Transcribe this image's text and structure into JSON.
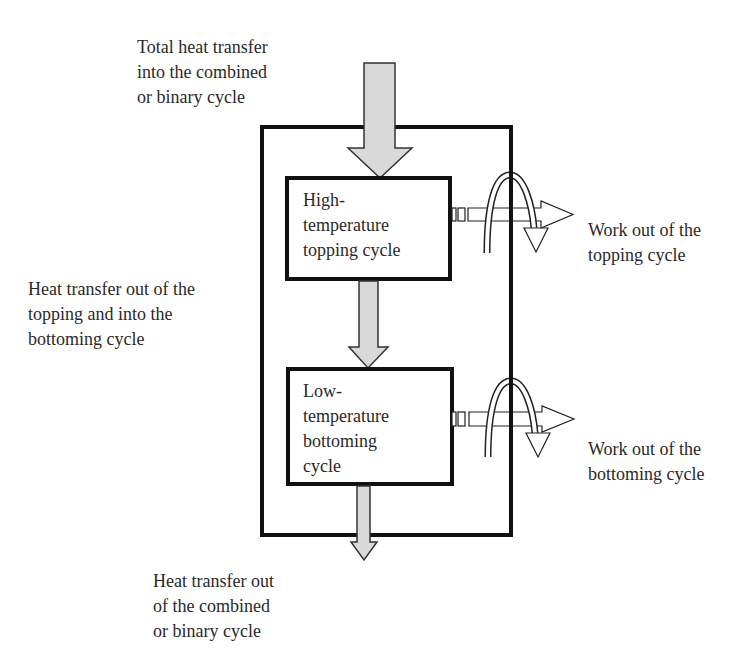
{
  "diagram": {
    "colors": {
      "line": "#111111",
      "arrow_fill": "#d9d9d9",
      "hollow_fill": "#ffffff",
      "text": "#2a2a2a",
      "background": "#ffffff"
    },
    "labels": {
      "heat_in": [
        "Total heat transfer",
        "into the combined",
        "or binary cycle"
      ],
      "heat_between": [
        "Heat transfer out of the",
        "topping and into the",
        "bottoming cycle"
      ],
      "heat_out": [
        "Heat transfer out",
        "of the combined",
        "or binary cycle"
      ],
      "work_topping": [
        "Work out of the",
        "topping cycle"
      ],
      "work_bottoming": [
        "Work out of the",
        "bottoming cycle"
      ]
    },
    "boxes": {
      "topping": [
        "High-",
        "temperature",
        "topping cycle"
      ],
      "bottoming": [
        "Low-",
        "temperature",
        "bottoming",
        "cycle"
      ]
    }
  }
}
